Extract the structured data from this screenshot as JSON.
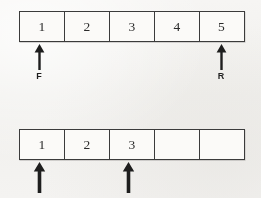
{
  "figure": {
    "type": "array-queue-diagram",
    "width": 261,
    "height": 198,
    "background_color": "#f3f2f0",
    "line_color": "#3b3b3b",
    "text_color": "#2b2b2b"
  },
  "arrays": [
    {
      "id": "top-array",
      "cell_count": 5,
      "cells": [
        {
          "index": 0,
          "value": "1"
        },
        {
          "index": 1,
          "value": "2"
        },
        {
          "index": 2,
          "value": "3"
        },
        {
          "index": 3,
          "value": "4"
        },
        {
          "index": 4,
          "value": "5"
        }
      ],
      "pointers": [
        {
          "id": "front-pointer",
          "label": "F",
          "cell_index": 0
        },
        {
          "id": "rear-pointer",
          "label": "R",
          "cell_index": 4
        }
      ]
    },
    {
      "id": "bottom-array",
      "cell_count": 5,
      "cells": [
        {
          "index": 0,
          "value": "1"
        },
        {
          "index": 1,
          "value": "2"
        },
        {
          "index": 2,
          "value": "3"
        },
        {
          "index": 3,
          "value": ""
        },
        {
          "index": 4,
          "value": ""
        }
      ],
      "pointers": [
        {
          "id": "bottom-pointer-left",
          "label": "",
          "cell_index": 0
        },
        {
          "id": "bottom-pointer-right",
          "label": "",
          "cell_index": 2
        }
      ]
    }
  ]
}
